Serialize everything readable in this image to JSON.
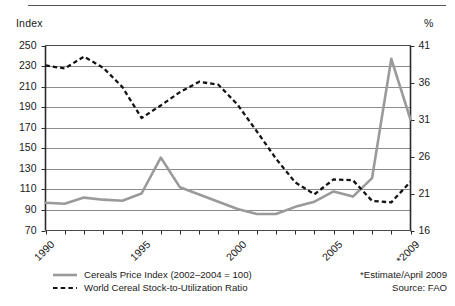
{
  "chart_data": {
    "type": "line",
    "title": "",
    "xlabel": "",
    "ylabel": "Index",
    "y2label": "%",
    "grid": true,
    "legend_position": "bottom-left",
    "x": [
      1990,
      1991,
      1992,
      1993,
      1994,
      1995,
      1996,
      1997,
      1998,
      1999,
      2000,
      2001,
      2002,
      2003,
      2004,
      2005,
      2006,
      2007,
      2008,
      2009
    ],
    "xtick_labels": [
      "1990",
      "1995",
      "2000",
      "2005",
      "*2009"
    ],
    "xtick_values": [
      1990,
      1995,
      2000,
      2005,
      2009
    ],
    "ylim": [
      70,
      250
    ],
    "ytick_labels": [
      "250",
      "230",
      "210",
      "190",
      "170",
      "150",
      "130",
      "110",
      "90",
      "70"
    ],
    "ytick_values": [
      250,
      230,
      210,
      190,
      170,
      150,
      130,
      110,
      90,
      70
    ],
    "y2lim": [
      16,
      41
    ],
    "y2tick_labels": [
      "41",
      "36",
      "31",
      "26",
      "21",
      "16"
    ],
    "y2tick_values": [
      41,
      36,
      31,
      26,
      21,
      16
    ],
    "series": [
      {
        "name": "Cereals Price Index (2002–2004 = 100)",
        "axis": "left",
        "style": "solid",
        "color": "#9a9a9a",
        "values": [
          97,
          96,
          102,
          100,
          99,
          106,
          141,
          112,
          105,
          98,
          91,
          86,
          86,
          93,
          98,
          108,
          103,
          121,
          237,
          178
        ]
      },
      {
        "name": "World Cereal Stock-to-Utilization Ratio",
        "axis": "right",
        "style": "dashed",
        "color": "#141414",
        "values": [
          38.3,
          37.9,
          39.5,
          38.0,
          35.4,
          31.2,
          32.9,
          34.7,
          36.1,
          35.7,
          33.0,
          29.4,
          25.7,
          22.5,
          20.9,
          22.9,
          22.8,
          20.0,
          19.8,
          22.6
        ]
      }
    ]
  },
  "axes": {
    "left_title": "Index",
    "right_title": "%"
  },
  "legend": {
    "items": [
      {
        "label": "Cereals Price Index (2002–2004 = 100)",
        "style": "solid",
        "color": "#9a9a9a"
      },
      {
        "label": "World Cereal Stock-to-Utilization Ratio",
        "style": "dashed",
        "color": "#141414"
      }
    ]
  },
  "notes": {
    "estimate": "*Estimate/April 2009",
    "source": "Source: FAO"
  }
}
